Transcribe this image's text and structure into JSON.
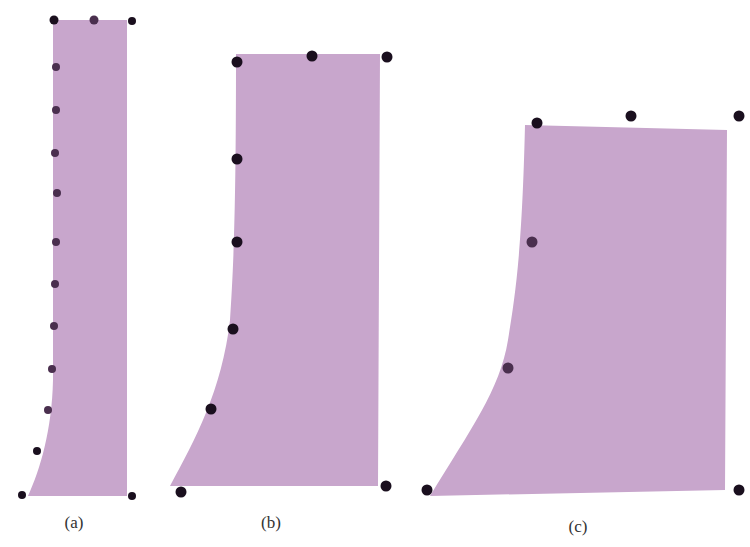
{
  "figure": {
    "fill_color": "#c8a6cc",
    "dot_color": "#1a0f1e",
    "dot_color_faded": "#4a2f4e",
    "panels": [
      {
        "id": "a",
        "label": "(a)",
        "label_pos": [
          74,
          528
        ],
        "shape_path": "M 53 20 L 127 20 L 127 496 L 28 496 C 40 470, 52 430, 53 380 L 53 20 Z",
        "dots": [
          {
            "x": 54,
            "y": 20,
            "r": 4.5,
            "dark": true
          },
          {
            "x": 94,
            "y": 20,
            "r": 4.5,
            "dark": false
          },
          {
            "x": 132,
            "y": 21,
            "r": 4,
            "dark": true
          },
          {
            "x": 56,
            "y": 67,
            "r": 4,
            "dark": false
          },
          {
            "x": 56,
            "y": 110,
            "r": 4,
            "dark": false
          },
          {
            "x": 55,
            "y": 153,
            "r": 4,
            "dark": false
          },
          {
            "x": 57,
            "y": 193,
            "r": 4,
            "dark": false
          },
          {
            "x": 56,
            "y": 242,
            "r": 4,
            "dark": false
          },
          {
            "x": 55,
            "y": 284,
            "r": 4,
            "dark": false
          },
          {
            "x": 54,
            "y": 326,
            "r": 4,
            "dark": false
          },
          {
            "x": 52,
            "y": 369,
            "r": 4,
            "dark": false
          },
          {
            "x": 48,
            "y": 410,
            "r": 4,
            "dark": false
          },
          {
            "x": 37,
            "y": 451,
            "r": 4,
            "dark": true
          },
          {
            "x": 22,
            "y": 495,
            "r": 4,
            "dark": true
          },
          {
            "x": 132,
            "y": 496,
            "r": 4,
            "dark": true
          }
        ]
      },
      {
        "id": "b",
        "label": "(b)",
        "label_pos": [
          271,
          528
        ],
        "shape_path": "M 236 54 L 380 54 L 378 486 L 170 486 C 195 440, 222 390, 230 320 C 234 260, 236 200, 236 54 Z",
        "dots": [
          {
            "x": 237,
            "y": 62,
            "r": 5.5,
            "dark": true
          },
          {
            "x": 312,
            "y": 56,
            "r": 5.5,
            "dark": true
          },
          {
            "x": 387,
            "y": 57,
            "r": 5.5,
            "dark": true
          },
          {
            "x": 237,
            "y": 159,
            "r": 5.5,
            "dark": true
          },
          {
            "x": 237,
            "y": 242,
            "r": 5.5,
            "dark": true
          },
          {
            "x": 233,
            "y": 329,
            "r": 5.5,
            "dark": true
          },
          {
            "x": 211,
            "y": 409,
            "r": 5.5,
            "dark": true
          },
          {
            "x": 181,
            "y": 492,
            "r": 5.5,
            "dark": true
          },
          {
            "x": 386,
            "y": 486,
            "r": 5.5,
            "dark": true
          }
        ]
      },
      {
        "id": "c",
        "label": "(c)",
        "label_pos": [
          578,
          532
        ],
        "shape_path": "M 525 125 L 727 130 L 725 490 L 430 496 C 470 430, 500 390, 508 340 C 516 290, 522 250, 525 125 Z",
        "dots": [
          {
            "x": 537,
            "y": 123,
            "r": 5.5,
            "dark": true
          },
          {
            "x": 631,
            "y": 116,
            "r": 5.5,
            "dark": true
          },
          {
            "x": 739,
            "y": 116,
            "r": 5.5,
            "dark": true
          },
          {
            "x": 532,
            "y": 242,
            "r": 5.5,
            "dark": false
          },
          {
            "x": 508,
            "y": 368,
            "r": 5.5,
            "dark": false
          },
          {
            "x": 427,
            "y": 490,
            "r": 5.5,
            "dark": true
          },
          {
            "x": 739,
            "y": 490,
            "r": 5.5,
            "dark": true
          }
        ]
      }
    ]
  }
}
